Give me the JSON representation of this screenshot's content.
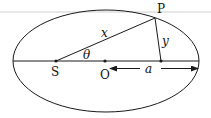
{
  "diagram": {
    "type": "ellipse-orbit",
    "labels": {
      "P": "P",
      "S": "S",
      "O": "O",
      "x": "x",
      "y": "y",
      "theta": "θ",
      "a": "a"
    },
    "colors": {
      "stroke": "#1a1a1a",
      "background": "#ffffff",
      "top_rule": "#c8c8c8"
    },
    "points": {
      "S": [
        56,
        61
      ],
      "O": [
        105,
        61
      ],
      "P": [
        155,
        18
      ],
      "foot": [
        161,
        61
      ]
    }
  }
}
